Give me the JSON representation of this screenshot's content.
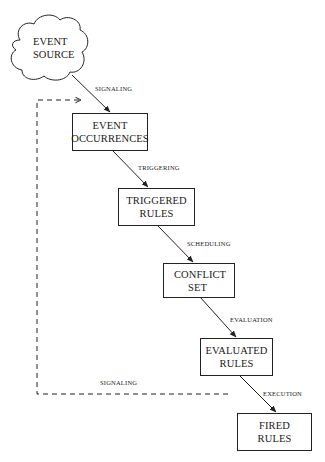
{
  "diagram": {
    "source": {
      "line1": "EVENT",
      "line2": "SOURCE"
    },
    "nodes": [
      {
        "line1": "EVENT",
        "line2": "OCCURRENCES"
      },
      {
        "line1": "TRIGGERED",
        "line2": "RULES"
      },
      {
        "line1": "CONFLICT",
        "line2": "SET"
      },
      {
        "line1": "EVALUATED",
        "line2": "RULES"
      },
      {
        "line1": "FIRED",
        "line2": "RULES"
      }
    ],
    "edges": [
      {
        "label": "SIGNALING",
        "from": "EVENT SOURCE",
        "to": "EVENT OCCURRENCES"
      },
      {
        "label": "TRIGGERING",
        "from": "EVENT OCCURRENCES",
        "to": "TRIGGERED RULES"
      },
      {
        "label": "SCHEDULING",
        "from": "TRIGGERED RULES",
        "to": "CONFLICT SET"
      },
      {
        "label": "EVALUATION",
        "from": "CONFLICT SET",
        "to": "EVALUATED RULES"
      },
      {
        "label": "EXECUTION",
        "from": "EVALUATED RULES",
        "to": "FIRED RULES"
      }
    ],
    "feedback_edge": {
      "label": "SIGNALING",
      "from": "EVALUATED RULES/EXECUTION",
      "to": "EVENT OCCURRENCES",
      "style": "dashed"
    }
  }
}
